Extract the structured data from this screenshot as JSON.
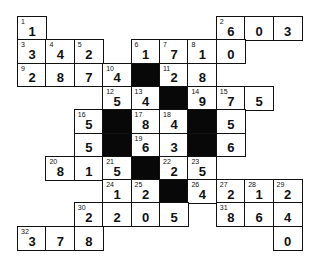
{
  "puzzle": {
    "type": "cross-number",
    "rows": 10,
    "cols": 10,
    "cells": [
      {
        "r": 0,
        "c": 0,
        "num": "1",
        "val": "1"
      },
      {
        "r": 0,
        "c": 7,
        "num": "2",
        "val": "6"
      },
      {
        "r": 0,
        "c": 8,
        "num": "",
        "val": "0"
      },
      {
        "r": 0,
        "c": 9,
        "num": "",
        "val": "3"
      },
      {
        "r": 1,
        "c": 0,
        "num": "3",
        "val": "3"
      },
      {
        "r": 1,
        "c": 1,
        "num": "4",
        "val": "4"
      },
      {
        "r": 1,
        "c": 2,
        "num": "5",
        "val": "2"
      },
      {
        "r": 1,
        "c": 4,
        "num": "6",
        "val": "1"
      },
      {
        "r": 1,
        "c": 5,
        "num": "7",
        "val": "7"
      },
      {
        "r": 1,
        "c": 6,
        "num": "8",
        "val": "1"
      },
      {
        "r": 1,
        "c": 7,
        "num": "",
        "val": "0"
      },
      {
        "r": 2,
        "c": 0,
        "num": "9",
        "val": "2"
      },
      {
        "r": 2,
        "c": 1,
        "num": "",
        "val": "8"
      },
      {
        "r": 2,
        "c": 2,
        "num": "",
        "val": "7"
      },
      {
        "r": 2,
        "c": 3,
        "num": "10",
        "val": "4"
      },
      {
        "r": 2,
        "c": 4,
        "black": true
      },
      {
        "r": 2,
        "c": 5,
        "num": "11",
        "val": "2"
      },
      {
        "r": 2,
        "c": 6,
        "num": "",
        "val": "8"
      },
      {
        "r": 3,
        "c": 3,
        "num": "12",
        "val": "5"
      },
      {
        "r": 3,
        "c": 4,
        "num": "13",
        "val": "4"
      },
      {
        "r": 3,
        "c": 5,
        "black": true
      },
      {
        "r": 3,
        "c": 6,
        "num": "14",
        "val": "9"
      },
      {
        "r": 3,
        "c": 7,
        "num": "15",
        "val": "7"
      },
      {
        "r": 3,
        "c": 8,
        "num": "",
        "val": "5"
      },
      {
        "r": 4,
        "c": 2,
        "num": "16",
        "val": "5"
      },
      {
        "r": 4,
        "c": 3,
        "black": true
      },
      {
        "r": 4,
        "c": 4,
        "num": "17",
        "val": "8"
      },
      {
        "r": 4,
        "c": 5,
        "num": "18",
        "val": "4"
      },
      {
        "r": 4,
        "c": 6,
        "black": true
      },
      {
        "r": 4,
        "c": 7,
        "num": "",
        "val": "5"
      },
      {
        "r": 5,
        "c": 2,
        "num": "",
        "val": "5"
      },
      {
        "r": 5,
        "c": 3,
        "black": true
      },
      {
        "r": 5,
        "c": 4,
        "num": "19",
        "val": "6"
      },
      {
        "r": 5,
        "c": 5,
        "num": "",
        "val": "3"
      },
      {
        "r": 5,
        "c": 6,
        "black": true
      },
      {
        "r": 5,
        "c": 7,
        "num": "",
        "val": "6"
      },
      {
        "r": 6,
        "c": 1,
        "num": "20",
        "val": "8"
      },
      {
        "r": 6,
        "c": 2,
        "num": "",
        "val": "1"
      },
      {
        "r": 6,
        "c": 3,
        "num": "21",
        "val": "5"
      },
      {
        "r": 6,
        "c": 4,
        "black": true
      },
      {
        "r": 6,
        "c": 5,
        "num": "22",
        "val": "2"
      },
      {
        "r": 6,
        "c": 6,
        "num": "23",
        "val": "5"
      },
      {
        "r": 7,
        "c": 3,
        "num": "24",
        "val": "1"
      },
      {
        "r": 7,
        "c": 4,
        "num": "25",
        "val": "2"
      },
      {
        "r": 7,
        "c": 5,
        "black": true
      },
      {
        "r": 7,
        "c": 6,
        "num": "26",
        "val": "4"
      },
      {
        "r": 7,
        "c": 7,
        "num": "27",
        "val": "2"
      },
      {
        "r": 7,
        "c": 8,
        "num": "28",
        "val": "1"
      },
      {
        "r": 7,
        "c": 9,
        "num": "29",
        "val": "2"
      },
      {
        "r": 8,
        "c": 2,
        "num": "30",
        "val": "2"
      },
      {
        "r": 8,
        "c": 3,
        "num": "",
        "val": "2"
      },
      {
        "r": 8,
        "c": 4,
        "num": "",
        "val": "0"
      },
      {
        "r": 8,
        "c": 5,
        "num": "",
        "val": "5"
      },
      {
        "r": 8,
        "c": 7,
        "num": "31",
        "val": "8"
      },
      {
        "r": 8,
        "c": 8,
        "num": "",
        "val": "6"
      },
      {
        "r": 8,
        "c": 9,
        "num": "",
        "val": "4"
      },
      {
        "r": 9,
        "c": 0,
        "num": "32",
        "val": "3"
      },
      {
        "r": 9,
        "c": 1,
        "num": "",
        "val": "7"
      },
      {
        "r": 9,
        "c": 2,
        "num": "",
        "val": "8"
      },
      {
        "r": 9,
        "c": 9,
        "num": "",
        "val": "0"
      }
    ]
  }
}
